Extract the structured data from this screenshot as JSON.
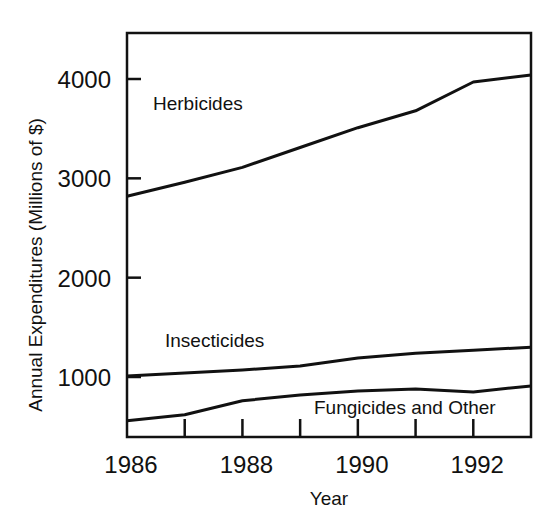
{
  "chart_data": {
    "type": "line",
    "title": "",
    "xlabel": "Year",
    "ylabel": "Annual Expenditures (Millions of $)",
    "x": [
      1986,
      1987,
      1988,
      1989,
      1990,
      1991,
      1992,
      1993
    ],
    "x_tick_labels": [
      "1986",
      "1988",
      "1990",
      "1992"
    ],
    "y_tick_labels": [
      "1000",
      "2000",
      "3000",
      "4000"
    ],
    "ylim": [
      450,
      4550
    ],
    "xlim": [
      1986,
      1993
    ],
    "grid": false,
    "legend": "inline labels",
    "series": [
      {
        "name": "Herbicides",
        "values": [
          2820,
          2960,
          3110,
          3310,
          3510,
          3680,
          3970,
          4040
        ]
      },
      {
        "name": "Insecticides",
        "values": [
          1010,
          1040,
          1070,
          1110,
          1190,
          1240,
          1270,
          1300
        ]
      },
      {
        "name": "Fungicides and Other",
        "values": [
          560,
          620,
          760,
          820,
          860,
          880,
          850,
          910
        ]
      }
    ]
  }
}
